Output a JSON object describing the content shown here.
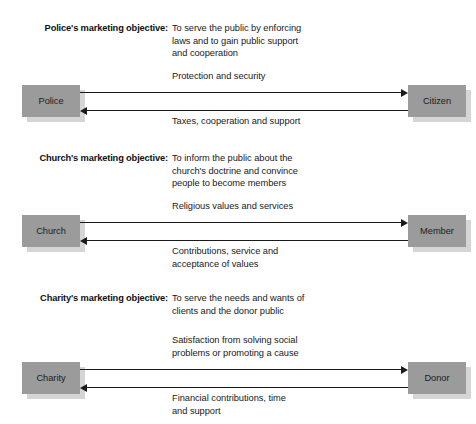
{
  "diagram": {
    "colors": {
      "box_fill": "#9b9b9b",
      "box_shadow": "#d5d5d5",
      "arrow": "#1a1a1a",
      "text": "#1a1a1a",
      "background": "#ffffff"
    },
    "sections": [
      {
        "id": "police",
        "objective_label": "Police's marketing objective:",
        "objective_lines": [
          "To serve the public by enforcing",
          "laws and to gain public support",
          "and cooperation"
        ],
        "left_entity": "Police",
        "right_entity": "Citizen",
        "outbound_flow_lines": [
          "Protection and security"
        ],
        "inbound_flow_lines": [
          "Taxes, cooperation and support"
        ]
      },
      {
        "id": "church",
        "objective_label": "Church's marketing objective:",
        "objective_lines": [
          "To inform the public about the",
          "church's doctrine and convince",
          "people to become members"
        ],
        "left_entity": "Church",
        "right_entity": "Member",
        "outbound_flow_lines": [
          "Religious values and services"
        ],
        "inbound_flow_lines": [
          "Contributions, service and",
          "acceptance of values"
        ]
      },
      {
        "id": "charity",
        "objective_label": "Charity's marketing objective:",
        "objective_lines": [
          "To serve the needs and wants of",
          "clients and the donor public"
        ],
        "left_entity": "Charity",
        "right_entity": "Donor",
        "outbound_flow_lines": [
          "Satisfaction from solving social",
          "problems or promoting a cause"
        ],
        "inbound_flow_lines": [
          "Financial contributions, time",
          "and support"
        ]
      }
    ]
  }
}
